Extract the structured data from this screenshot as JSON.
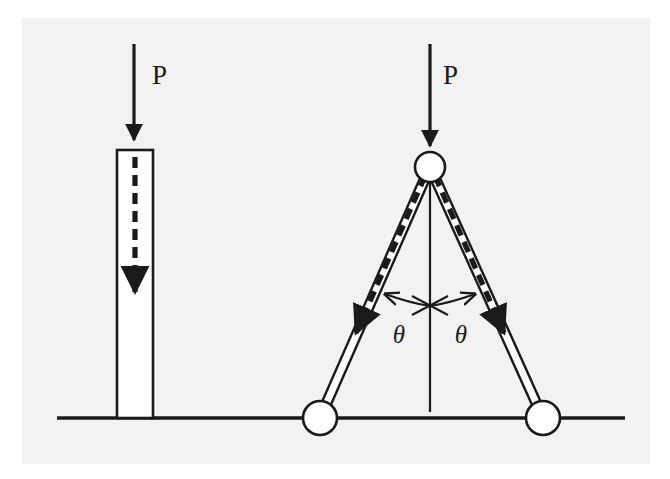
{
  "figure": {
    "background_color": "#f2f2f2",
    "page_color": "#ffffff",
    "ink_color": "#1a1a1a",
    "member_fill": "#ffffff"
  },
  "ground": {
    "name": "ground-line",
    "x1": 57,
    "x2": 625,
    "y": 418
  },
  "left_figure": {
    "name": "straight-column-case",
    "load_label": "P",
    "load_label_x": 152,
    "load_label_y": 84,
    "load_arrow": {
      "x": 134,
      "y_start": 44,
      "y_end": 146
    },
    "column": {
      "x": 117,
      "y": 150,
      "width": 36,
      "height": 268
    },
    "internal_arrow": {
      "x": 135,
      "y_start": 158,
      "y_end": 300,
      "dash_pattern": "11 7"
    }
  },
  "right_figure": {
    "name": "two-bar-truss-case",
    "load_label": "P",
    "load_label_x": 443,
    "load_label_y": 84,
    "load_arrow": {
      "x": 430,
      "y_start": 44,
      "y_end": 152
    },
    "apex_joint": {
      "cx": 430,
      "cy": 167,
      "r": 15
    },
    "left_base_joint": {
      "cx": 320,
      "cy": 418,
      "r": 17
    },
    "right_base_joint": {
      "cx": 543,
      "cy": 418,
      "r": 17
    },
    "centerline": {
      "x": 430,
      "y_start": 167,
      "y_end": 412
    },
    "bar_half_width": 7,
    "left_bar_force_arrow": {
      "dash_pattern": "11 7",
      "direction": "down-left"
    },
    "right_bar_force_arrow": {
      "dash_pattern": "11 7",
      "direction": "down-right"
    },
    "angle_labels": [
      {
        "text": "θ",
        "x": 399,
        "y": 333
      },
      {
        "text": "θ",
        "x": 458,
        "y": 333
      }
    ],
    "angle_arc": {
      "name": "angle-arc-double-arrow",
      "cx": 430,
      "cy": 306,
      "note": "double-headed arc spanning between the two inclined bars"
    },
    "center_cross_mark": {
      "name": "centerline-cross-tick",
      "cx": 430,
      "cy": 304
    }
  }
}
